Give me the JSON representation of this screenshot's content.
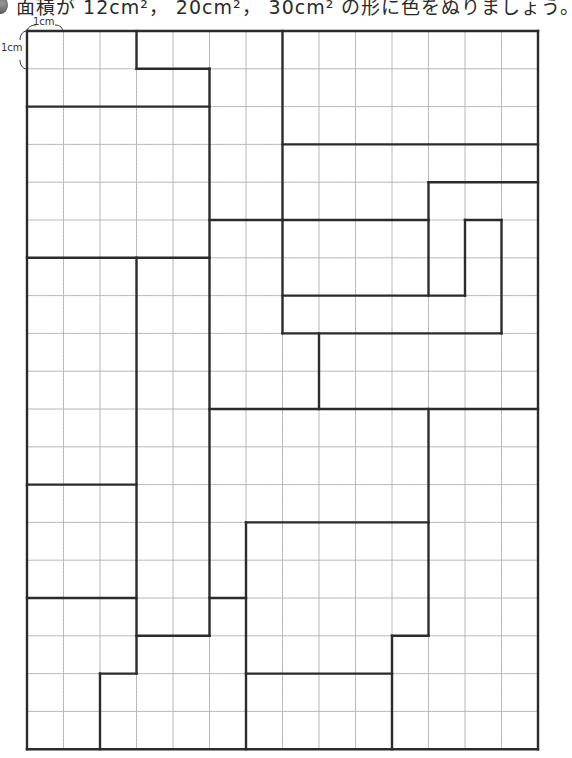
{
  "worksheet": {
    "instruction": "面積が 12cm²， 20cm²， 30cm² の形に色をぬりましょう。",
    "unit_label_top": "1cm",
    "unit_label_left": "1cm"
  },
  "grid": {
    "origin_x": 27,
    "origin_y": 31,
    "cell_w": 36.5,
    "cell_h": 37.8,
    "cols": 14,
    "rows": 19,
    "grid_color": "#b5b5b5",
    "line_color": "#2b2b2b",
    "segments": [
      [
        0,
        0,
        14,
        0
      ],
      [
        0,
        19,
        14,
        19
      ],
      [
        0,
        0,
        0,
        19
      ],
      [
        14,
        0,
        14,
        19
      ],
      [
        3,
        0,
        3,
        1
      ],
      [
        3,
        1,
        5,
        1
      ],
      [
        5,
        1,
        5,
        16
      ],
      [
        0,
        2,
        5,
        2
      ],
      [
        0,
        6,
        5,
        6
      ],
      [
        5,
        5,
        7,
        5
      ],
      [
        7,
        0,
        7,
        8
      ],
      [
        7,
        3,
        14,
        3
      ],
      [
        11,
        4,
        14,
        4
      ],
      [
        11,
        4,
        11,
        7
      ],
      [
        7,
        5,
        11,
        5
      ],
      [
        12,
        5,
        13,
        5
      ],
      [
        12,
        5,
        12,
        7
      ],
      [
        13,
        5,
        13,
        8
      ],
      [
        7,
        7,
        12,
        7
      ],
      [
        7,
        8,
        13,
        8
      ],
      [
        8,
        8,
        8,
        10
      ],
      [
        5,
        10,
        14,
        10
      ],
      [
        3,
        6,
        3,
        17
      ],
      [
        0,
        12,
        3,
        12
      ],
      [
        0,
        15,
        3,
        15
      ],
      [
        2,
        17,
        3,
        17
      ],
      [
        2,
        17,
        2,
        19
      ],
      [
        3,
        16,
        5,
        16
      ],
      [
        5,
        15,
        6,
        15
      ],
      [
        6,
        13,
        6,
        19
      ],
      [
        6,
        13,
        11,
        13
      ],
      [
        11,
        10,
        11,
        16
      ],
      [
        10,
        16,
        11,
        16
      ],
      [
        10,
        16,
        10,
        19
      ],
      [
        6,
        17,
        10,
        17
      ]
    ]
  }
}
